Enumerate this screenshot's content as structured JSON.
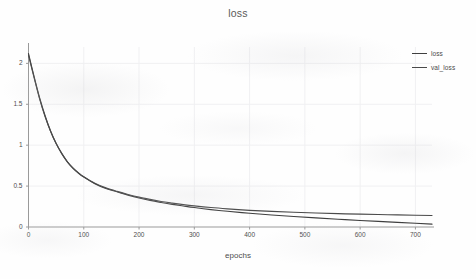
{
  "chart_data": {
    "type": "line",
    "title": "loss",
    "xlabel": "epochs",
    "ylabel": "",
    "xlim": [
      0,
      730
    ],
    "ylim": [
      0,
      2.2
    ],
    "grid": true,
    "legend_position": "upper right outside",
    "xticks": [
      "0",
      "100",
      "200",
      "300",
      "400",
      "500",
      "600",
      "700"
    ],
    "xtick_values": [
      0,
      100,
      200,
      300,
      400,
      500,
      600,
      700
    ],
    "yticks": [
      "0",
      "0.5",
      "1",
      "1.5",
      "2"
    ],
    "ytick_values": [
      0,
      0.5,
      1,
      1.5,
      2
    ],
    "x": [
      0,
      10,
      20,
      30,
      40,
      50,
      60,
      70,
      80,
      90,
      100,
      120,
      140,
      160,
      180,
      200,
      220,
      240,
      260,
      280,
      300,
      330,
      360,
      400,
      440,
      480,
      520,
      560,
      600,
      650,
      700,
      730
    ],
    "series": [
      {
        "name": "loss",
        "color": "#3f3f3f",
        "values": [
          2.12,
          1.84,
          1.58,
          1.36,
          1.17,
          1.02,
          0.9,
          0.8,
          0.72,
          0.66,
          0.61,
          0.53,
          0.47,
          0.43,
          0.39,
          0.355,
          0.325,
          0.3,
          0.277,
          0.257,
          0.238,
          0.213,
          0.192,
          0.168,
          0.147,
          0.128,
          0.111,
          0.095,
          0.08,
          0.062,
          0.046,
          0.035
        ]
      },
      {
        "name": "val_loss",
        "color": "#4a4a4a",
        "values": [
          2.1,
          1.83,
          1.57,
          1.35,
          1.17,
          1.02,
          0.9,
          0.8,
          0.725,
          0.665,
          0.615,
          0.535,
          0.478,
          0.435,
          0.398,
          0.365,
          0.337,
          0.312,
          0.292,
          0.274,
          0.258,
          0.238,
          0.222,
          0.204,
          0.191,
          0.18,
          0.171,
          0.163,
          0.157,
          0.15,
          0.144,
          0.141
        ]
      }
    ]
  },
  "legend": {
    "entries": [
      {
        "label": "loss"
      },
      {
        "label": "val_loss"
      }
    ]
  },
  "axis": {
    "spine_color": "#9a9a9a",
    "grid_color": "#f0f0f2",
    "tick_color": "#4d4d4d"
  }
}
